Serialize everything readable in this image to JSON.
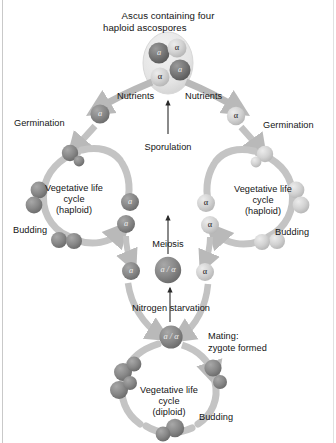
{
  "figure": {
    "title_line1": "Ascus containing four",
    "title_line2": "haploid ascospores",
    "organism": "yeast",
    "background_color": "#ffffff",
    "ink_color": "#141414",
    "arrow_color": "#b9b9b9",
    "cell_dark_color": "#6f6f6f",
    "cell_light_color": "#cdcdcd",
    "ascus_color": "#e2e2e2"
  },
  "labels": {
    "nutrients_left": "Nutrients",
    "nutrients_right": "Nutrients",
    "germination_left": "Germination",
    "germination_right": "Germination",
    "sporulation": "Sporulation",
    "meiosis": "Meiosis",
    "nitrogen_starvation": "Nitrogen starvation",
    "mating_line1": "Mating:",
    "mating_line2": "zygote formed",
    "budding_left": "Budding",
    "budding_right": "Budding",
    "budding_bottom": "Budding",
    "veg_haploid_left_line1": "Vegetative life",
    "veg_haploid_left_line2": "cycle",
    "veg_haploid_left_line3": "(haploid)",
    "veg_haploid_right_line1": "Vegetative life",
    "veg_haploid_right_line2": "cycle",
    "veg_haploid_right_line3": "(haploid)",
    "veg_diploid_line1": "Vegetative life",
    "veg_diploid_line2": "cycle",
    "veg_diploid_line3": "(diploid)"
  },
  "cell_types": {
    "a": "a",
    "alpha": "α",
    "diploid": "a / α"
  },
  "ascus": {
    "label": "ascus",
    "spores": [
      {
        "id": "spore-a-1",
        "type": "a",
        "shade": "dark"
      },
      {
        "id": "spore-alpha-1",
        "type": "α",
        "shade": "light"
      },
      {
        "id": "spore-alpha-2",
        "type": "α",
        "shade": "light"
      },
      {
        "id": "spore-a-2",
        "type": "a",
        "shade": "dark"
      }
    ]
  },
  "haploid_cells_left": [
    {
      "id": "a-germinating",
      "type": "a"
    },
    {
      "id": "a-cycle-exit-1",
      "type": "a"
    },
    {
      "id": "a-cycle-exit-2",
      "type": "a"
    },
    {
      "id": "a-to-mating",
      "type": "a"
    }
  ],
  "haploid_cells_right": [
    {
      "id": "alpha-germinating",
      "type": "α"
    },
    {
      "id": "alpha-cycle-exit-1",
      "type": "α"
    },
    {
      "id": "alpha-cycle-exit-2",
      "type": "α"
    },
    {
      "id": "alpha-to-mating",
      "type": "α"
    }
  ],
  "diploid_cells": [
    {
      "id": "diploid-meiosis",
      "type": "a / α"
    },
    {
      "id": "diploid-zygote",
      "type": "a / α"
    }
  ],
  "flow": {
    "steps": [
      "Ascus containing four haploid ascospores",
      "Nutrients",
      "Germination",
      "Vegetative life cycle (haploid)",
      "Budding",
      "Nitrogen starvation",
      "Mating: zygote formed",
      "Vegetative life cycle (diploid)",
      "Meiosis",
      "Sporulation"
    ]
  }
}
